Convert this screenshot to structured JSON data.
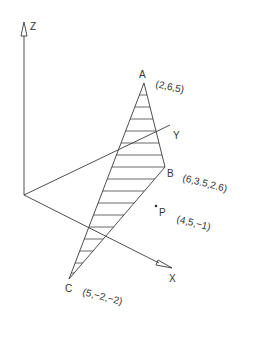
{
  "diagram": {
    "type": "3d-coordinate-plane-triangle",
    "axes": {
      "z": {
        "label": "Z"
      },
      "y": {
        "label": "Y"
      },
      "x": {
        "label": "X"
      }
    },
    "points": {
      "A": {
        "label": "A",
        "coords": "(2,6,5)"
      },
      "B": {
        "label": "B",
        "coords": "(6,3.5,2.6)"
      },
      "C": {
        "label": "C",
        "coords": "(5,−2,−2)"
      },
      "P": {
        "label": "P",
        "coords": "(4,5,−1)"
      }
    },
    "colors": {
      "line": "#3a3a3a",
      "background": "#ffffff"
    }
  }
}
